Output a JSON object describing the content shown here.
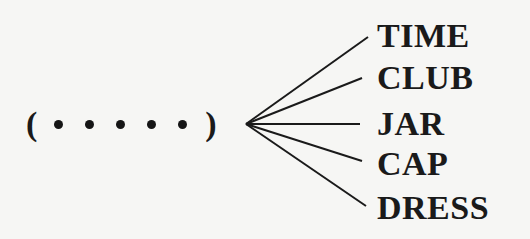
{
  "diagram": {
    "pattern": {
      "open_paren": "(",
      "close_paren": ")",
      "slot_count": 5
    },
    "words": [
      {
        "label": "TIME",
        "line_end": [
          368,
          37
        ],
        "top": 19
      },
      {
        "label": "CLUB",
        "line_end": [
          362,
          78
        ],
        "top": 61
      },
      {
        "label": "JAR",
        "line_end": [
          360,
          124
        ],
        "top": 107
      },
      {
        "label": "CAP",
        "line_end": [
          362,
          161
        ],
        "top": 147
      },
      {
        "label": "DRESS",
        "line_end": [
          366,
          206
        ],
        "top": 191
      }
    ],
    "hub": [
      246,
      124
    ],
    "line_color": "#1a1a1a",
    "text_color": "#1a1a1a"
  }
}
